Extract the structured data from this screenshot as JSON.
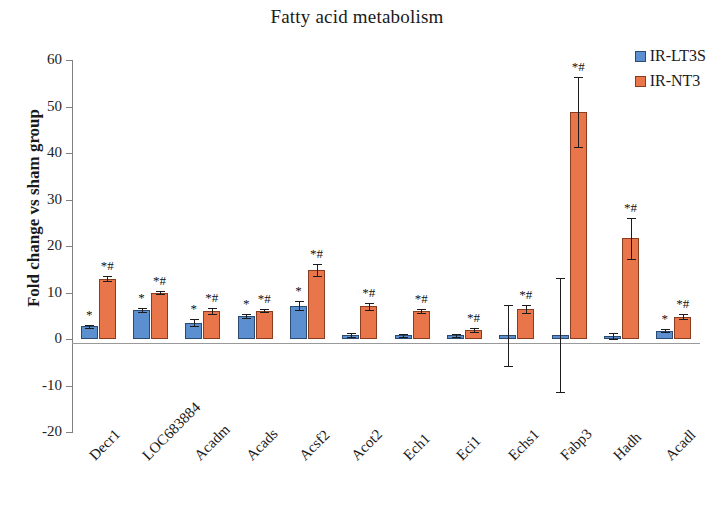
{
  "chart_data": {
    "type": "bar",
    "title": "Fatty acid metabolism",
    "xlabel": "",
    "ylabel": "Fold change vs sham group",
    "ylim": [
      -20,
      60
    ],
    "yticks": [
      -20,
      -10,
      0,
      10,
      20,
      30,
      40,
      50,
      60
    ],
    "grid": false,
    "legend_position": "top-right",
    "categories": [
      "Decr1",
      "LOC683884",
      "Acadm",
      "Acads",
      "Acsf2",
      "Acot2",
      "Ech1",
      "Eci1",
      "Echs1",
      "Fabp3",
      "Hadh",
      "Acadl"
    ],
    "series": [
      {
        "name": "IR-LT3S",
        "color": "#5b8fd0",
        "values": [
          2.7,
          6.2,
          3.5,
          4.9,
          7.2,
          0.9,
          0.8,
          0.8,
          0.8,
          0.8,
          0.7,
          1.8
        ],
        "errors": [
          0.4,
          0.5,
          0.7,
          0.4,
          1.0,
          0.4,
          0.3,
          0.3,
          6.6,
          12.3,
          0.6,
          0.4
        ],
        "significance": [
          "*",
          "*",
          "*",
          "*",
          "*",
          "",
          "",
          "",
          "",
          "",
          "",
          "*"
        ]
      },
      {
        "name": "IR-NT3",
        "color": "#e8764a",
        "values": [
          13.0,
          10.0,
          6.0,
          6.1,
          14.8,
          7.0,
          6.0,
          1.9,
          6.4,
          48.8,
          21.7,
          4.8
        ],
        "errors": [
          0.5,
          0.4,
          0.7,
          0.4,
          1.3,
          0.8,
          0.5,
          0.4,
          0.9,
          7.6,
          4.4,
          0.5
        ],
        "significance": [
          "*#",
          "*#",
          "*#",
          "*#",
          "*#",
          "*#",
          "*#",
          "*#",
          "*#",
          "*#",
          "*#",
          "*#"
        ]
      }
    ]
  },
  "legend": {
    "items": [
      {
        "label": "IR-LT3S",
        "color": "#5b8fd0"
      },
      {
        "label": "IR-NT3",
        "color": "#e8764a"
      }
    ]
  }
}
